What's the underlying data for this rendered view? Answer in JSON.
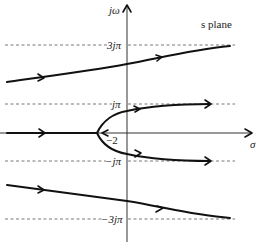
{
  "diagram": {
    "title": "s plane",
    "axes": {
      "vertical_label": "jω",
      "horizontal_label": "σ"
    },
    "tick_labels": {
      "pos_3jpi": "3jπ",
      "pos_jpi": "jπ",
      "neg_jpi": "−jπ",
      "neg_3jpi": "−3jπ",
      "breakaway": "−2"
    },
    "guide_lines": [
      {
        "name": "3jπ",
        "y": 45
      },
      {
        "name": "jπ",
        "y": 104
      },
      {
        "name": "−jπ",
        "y": 161
      },
      {
        "name": "−3jπ",
        "y": 219
      }
    ],
    "branches": [
      {
        "name": "upper-outer",
        "description": "from left, rising toward 3jπ asymptote, arrows pointing right"
      },
      {
        "name": "upper-inner",
        "description": "from breakaway at −2 curving up toward jπ asymptote"
      },
      {
        "name": "real-axis",
        "description": "along negative real axis to breakaway at −2"
      },
      {
        "name": "lower-inner",
        "description": "from breakaway at −2 curving down toward −jπ asymptote"
      },
      {
        "name": "lower-outer",
        "description": "from left, descending toward −3jπ asymptote"
      }
    ],
    "colors": {
      "locus": "#111111",
      "axis": "#333333",
      "guide": "#555555"
    }
  }
}
